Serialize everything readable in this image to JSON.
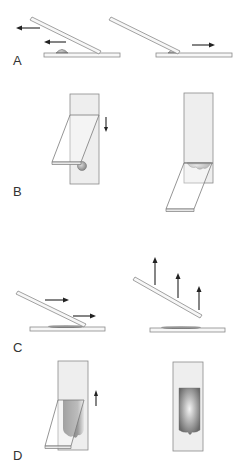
{
  "figure": {
    "panels": [
      {
        "id": "A",
        "label": "A",
        "description": "Drop placed on slide; spreader slide drawn back into drop, then pushed forward"
      },
      {
        "id": "B",
        "label": "B",
        "description": "Top view: spreader lowered toward drop; drop spreads along spreader edge"
      },
      {
        "id": "C",
        "label": "C",
        "description": "Spreader pushed forward to make smear, then lifted off"
      },
      {
        "id": "D",
        "label": "D",
        "description": "Top view: smear formed behind moving spreader; finished feathered smear"
      }
    ],
    "colors": {
      "background": "#ffffff",
      "slide_fill": "#f5f5f5",
      "slide_stroke": "#8a8a8a",
      "arrow": "#222222",
      "smear_dark": "#6e6e6e",
      "smear_light": "#f2f2f2",
      "label": "#333333"
    }
  }
}
